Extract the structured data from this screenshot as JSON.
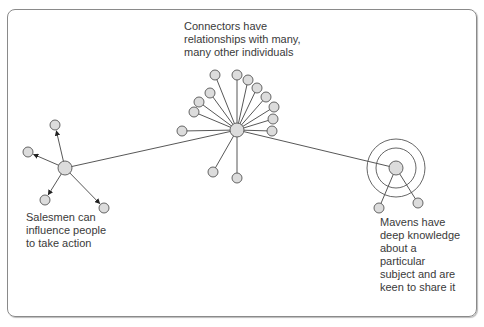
{
  "colors": {
    "node_fill": "#dcdcdc",
    "node_stroke": "#555555",
    "edge": "#444444",
    "text": "#3a3a3a",
    "frame": "#8a8a8a"
  },
  "labels": {
    "connectors": [
      "Connectors have",
      "relationships with many,",
      "many other individuals"
    ],
    "salesmen": [
      "Salesmen can",
      "influence people",
      "to take action"
    ],
    "mavens": [
      "Mavens have",
      "deep knowledge",
      "about a",
      "particular",
      "subject and are",
      "keen to share it"
    ]
  },
  "diagram": {
    "connector": {
      "hub": [
        237,
        130
      ],
      "satellites": [
        [
          215,
          75
        ],
        [
          237,
          75
        ],
        [
          248,
          80
        ],
        [
          257,
          88
        ],
        [
          210,
          93
        ],
        [
          266,
          97
        ],
        [
          199,
          102
        ],
        [
          274,
          107
        ],
        [
          194,
          112
        ],
        [
          273,
          119
        ],
        [
          272,
          131
        ],
        [
          182,
          131
        ],
        [
          213,
          172
        ],
        [
          237,
          178
        ]
      ]
    },
    "salesman": {
      "hub": [
        65,
        168
      ],
      "targets": [
        [
          55,
          125
        ],
        [
          28,
          152
        ],
        [
          45,
          200
        ],
        [
          104,
          208
        ]
      ]
    },
    "maven": {
      "hub": [
        396,
        168
      ],
      "rings": [
        20,
        29
      ],
      "satellites": [
        [
          379,
          208
        ],
        [
          418,
          203
        ]
      ]
    },
    "links": [
      [
        "salesman",
        "connector"
      ],
      [
        "connector",
        "maven"
      ]
    ]
  }
}
